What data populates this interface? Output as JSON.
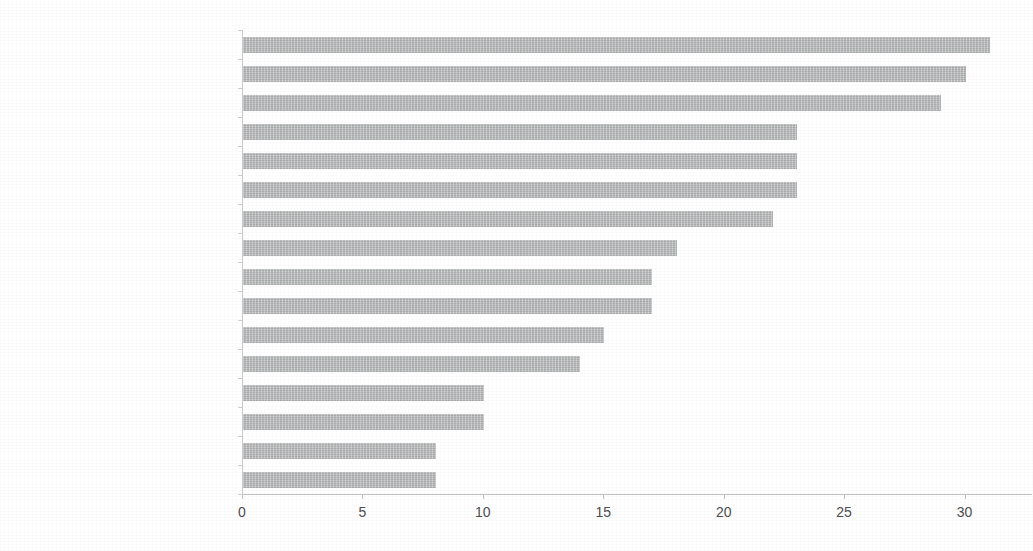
{
  "chart_data": {
    "type": "bar",
    "orientation": "horizontal",
    "title": "",
    "subtitle": "",
    "xlabel": "",
    "ylabel": "",
    "xlim": [
      0,
      32.8
    ],
    "ylim": null,
    "grid": false,
    "legend": null,
    "legend_position": "none",
    "bar_color": "#b6b7b8",
    "text_color": "#55565a",
    "axis_color": "#c2c2c2",
    "xticks": [
      0,
      5,
      10,
      15,
      20,
      25,
      30
    ],
    "xtick_labels": [
      "0",
      "5",
      "10",
      "15",
      "20",
      "25",
      "30"
    ],
    "categories": [
      "Brennamann/Nuxhall CIN 74-04",
      "Scully/Doggett LAN 58-87",
      "Buck/Shannon SLN 72-75, 77-01",
      "Hodges/Simmons SFN 58-70",
      "Chandler/Coleman SDN 72-77, 84-00",
      "Uecker/Powell MIL 96-08",
      "Kalas/Ashburn PHI 76-97",
      "Lloyd/Boudreau CHN 65-82",
      "Nelson/Murphy/Kiner NYN 62-78",
      "Caray/Sutton ATL 90-06",
      "Frattare/Blass PIT 94-08",
      "Elston/Passe HOU 62-75",
      "Van Horne/Snider MON 77-86",
      "Hagin/Kingery COL 93-02",
      "Angel/O'Brien FLO 93-00",
      "Schulte/Candiotti ARI 06-14"
    ],
    "values": [
      31,
      30,
      29,
      23,
      23,
      23,
      22,
      18,
      17,
      17,
      15,
      14,
      10,
      10,
      8,
      8
    ]
  }
}
